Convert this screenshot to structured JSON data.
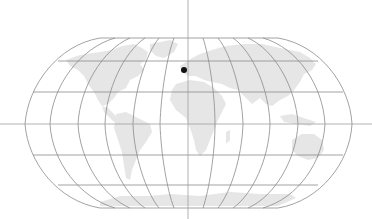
{
  "map": {
    "projection": "Robinson",
    "graticule_step_degrees": 30,
    "colors": {
      "background": "#ffffff",
      "land": "#e6e6e6",
      "graticule": "#8a8a8a",
      "crosshair": "#a0a0a0",
      "marker": "#111111"
    },
    "crosshair": {
      "x": 188,
      "y": 124
    },
    "marker": {
      "label": "location-marker",
      "x": 184,
      "y": 70,
      "radius": 3
    }
  }
}
